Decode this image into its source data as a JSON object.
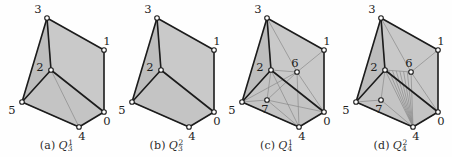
{
  "figure": {
    "background": "#fefefe",
    "panel_count": 4
  },
  "style": {
    "face_top_fill": "#c9c9c9",
    "face_front_fill": "#c4c4c4",
    "face_side_fill": "#bdbdbd",
    "outline_color": "#1c1c1c",
    "internal_edge_color": "#8d8d8d",
    "node_fill": "#ffffff",
    "node_stroke": "#1c1c1c",
    "label_color": "#1d1d1d",
    "outline_width": 1.6,
    "internal_width": 0.75,
    "node_radius": 2.3
  },
  "geometry": {
    "vertices": {
      "v3": {
        "x": 47,
        "y": 18
      },
      "v1": {
        "x": 104,
        "y": 50
      },
      "v2": {
        "x": 51,
        "y": 70
      },
      "v5": {
        "x": 22,
        "y": 102
      },
      "v0": {
        "x": 104,
        "y": 112
      },
      "v4": {
        "x": 79,
        "y": 127
      },
      "v6": {
        "x": 77,
        "y": 72
      },
      "v7": {
        "x": 47,
        "y": 100
      }
    },
    "label_offsets": {
      "v3": {
        "dx": -9,
        "dy": -5
      },
      "v1": {
        "dx": 3,
        "dy": -5
      },
      "v2": {
        "dx": -11,
        "dy": 1
      },
      "v5": {
        "dx": -10,
        "dy": 12
      },
      "v0": {
        "dx": 3,
        "dy": 13
      },
      "v4": {
        "dx": 3,
        "dy": 13
      },
      "v6": {
        "dx": -2,
        "dy": -5
      },
      "v7": {
        "dx": -2,
        "dy": 13
      }
    }
  },
  "panels": [
    {
      "id": "panel-a",
      "x": 0,
      "caption_prefix": "(a)",
      "symbol": "Q",
      "subscript": "3",
      "superscript": "1",
      "nodes": [
        "0",
        "1",
        "2",
        "3",
        "4",
        "5"
      ],
      "internal_edges": [
        [
          "v2",
          "v5"
        ],
        [
          "v2",
          "v4"
        ],
        [
          "v2",
          "v0"
        ],
        [
          "v2",
          "v3"
        ],
        [
          "v5",
          "v4"
        ],
        [
          "v4",
          "v0"
        ]
      ]
    },
    {
      "id": "panel-b",
      "x": 110,
      "caption_prefix": "(b)",
      "symbol": "Q",
      "subscript": "3",
      "superscript": "2",
      "nodes": [
        "0",
        "1",
        "2",
        "3",
        "4",
        "5"
      ],
      "internal_edges": [
        [
          "v2",
          "v5"
        ],
        [
          "v2",
          "v0"
        ],
        [
          "v2",
          "v3"
        ],
        [
          "v5",
          "v4"
        ],
        [
          "v4",
          "v0"
        ]
      ]
    },
    {
      "id": "panel-c",
      "x": 220,
      "caption_prefix": "(c)",
      "symbol": "Q",
      "subscript": "4",
      "superscript": "1",
      "nodes": [
        "0",
        "1",
        "2",
        "3",
        "4",
        "5",
        "6",
        "7"
      ],
      "internal_edges": [
        [
          "v2",
          "v5"
        ],
        [
          "v2",
          "v4"
        ],
        [
          "v2",
          "v0"
        ],
        [
          "v2",
          "v3"
        ],
        [
          "v5",
          "v4"
        ],
        [
          "v4",
          "v0"
        ],
        [
          "v2",
          "v6"
        ],
        [
          "v6",
          "v1"
        ],
        [
          "v6",
          "v3"
        ],
        [
          "v6",
          "v4"
        ],
        [
          "v6",
          "v0"
        ],
        [
          "v6",
          "v5"
        ],
        [
          "v2",
          "v7"
        ],
        [
          "v7",
          "v5"
        ],
        [
          "v7",
          "v4"
        ],
        [
          "v7",
          "v0"
        ],
        [
          "v7",
          "v6"
        ]
      ]
    },
    {
      "id": "panel-d",
      "x": 334,
      "caption_prefix": "(d)",
      "symbol": "Q",
      "subscript": "4",
      "superscript": "2",
      "nodes": [
        "0",
        "1",
        "2",
        "3",
        "4",
        "5",
        "6",
        "7"
      ],
      "internal_edges": [
        [
          "v2",
          "v5"
        ],
        [
          "v2",
          "v4"
        ],
        [
          "v2",
          "v0"
        ],
        [
          "v2",
          "v3"
        ],
        [
          "v5",
          "v4"
        ],
        [
          "v4",
          "v0"
        ],
        [
          "v2",
          "v6"
        ],
        [
          "v6",
          "v1"
        ],
        [
          "v6",
          "v3"
        ],
        [
          "v6",
          "v4"
        ],
        [
          "v6",
          "v0"
        ],
        [
          "v2",
          "v7"
        ],
        [
          "v7",
          "v5"
        ],
        [
          "v7",
          "v4"
        ]
      ],
      "fan_from": "v2",
      "fan_to": "v4",
      "fan_count": 6
    }
  ]
}
